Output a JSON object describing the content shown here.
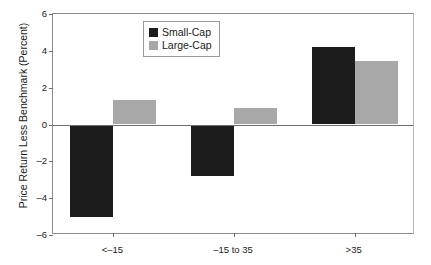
{
  "chart_data": {
    "type": "bar",
    "title": "",
    "subtitle": "",
    "xlabel": "",
    "ylabel": "Price Return Less Benchmark (Percent)",
    "categories": [
      "<–15",
      "–15 to 35",
      ">35"
    ],
    "series": [
      {
        "name": "Small-Cap",
        "color": "#1c1c1c",
        "values": [
          -5.0,
          -2.8,
          4.2
        ]
      },
      {
        "name": "Large-Cap",
        "color": "#a8a8a8",
        "values": [
          1.35,
          0.9,
          3.45
        ]
      }
    ],
    "ylim": [
      -6,
      6
    ],
    "yticks": [
      6,
      4,
      2,
      0,
      -2,
      -4,
      -6
    ],
    "ytick_labels": [
      "6",
      "4",
      "2",
      "0",
      "–2",
      "–4",
      "–6"
    ],
    "grid": false,
    "legend_position": "top-center",
    "zero_line": 0
  },
  "legend": {
    "entries": [
      {
        "label": "Small-Cap"
      },
      {
        "label": "Large-Cap"
      }
    ]
  }
}
